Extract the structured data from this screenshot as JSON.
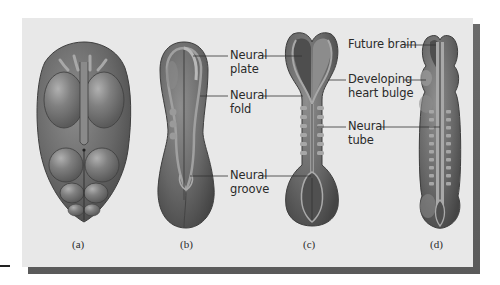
{
  "figure": {
    "panels": [
      {
        "id": "a",
        "caption": "(a)"
      },
      {
        "id": "b",
        "caption": "(b)"
      },
      {
        "id": "c",
        "caption": "(c)"
      },
      {
        "id": "d",
        "caption": "(d)"
      }
    ],
    "labels": {
      "neural_plate": {
        "line1": "Neural",
        "line2": "plate"
      },
      "neural_fold": {
        "line1": "Neural",
        "line2": "fold"
      },
      "neural_groove": {
        "line1": "Neural",
        "line2": "groove"
      },
      "future_brain": {
        "line1": "Future brain"
      },
      "heart_bulge": {
        "line1": "Developing",
        "line2": "heart bulge"
      },
      "neural_tube": {
        "line1": "Neural",
        "line2": "tube"
      }
    },
    "colors": {
      "panel_bg": "#e8e8e8",
      "shadow": "#5e5e5e",
      "embryo_dark": "#4a4a4a",
      "embryo_mid": "#6e6e6e",
      "embryo_light": "#9a9a9a",
      "text": "#2a2a2a"
    }
  }
}
